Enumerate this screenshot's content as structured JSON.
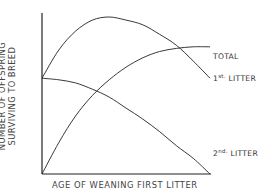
{
  "chart_data": {
    "type": "line",
    "title": "",
    "xlabel": "AGE OF WEANING FIRST LITTER",
    "ylabel_lines": [
      "NUMBER OF OFFSPRING",
      "SURVIVING TO BREED"
    ],
    "ylabel": "NUMBER OF OFFSPRING SURVIVING TO BREED",
    "x_ticks": [],
    "y_ticks": [],
    "grid": false,
    "legend": "inline labels at right end of each curve",
    "x": [
      0,
      0.1,
      0.2,
      0.3,
      0.4,
      0.5,
      0.6,
      0.7,
      0.8,
      0.9,
      1.0
    ],
    "xlim": [
      0,
      1
    ],
    "ylim": [
      0,
      1
    ],
    "series": [
      {
        "name": "TOTAL",
        "label_main": "TOTAL",
        "label_sup": "",
        "values": [
          0.61,
          0.79,
          0.91,
          0.98,
          1.0,
          0.98,
          0.95,
          0.89,
          0.82,
          0.72,
          0.61
        ]
      },
      {
        "name": "1st. LITTER",
        "label_main": " LITTER",
        "label_prefix": "1",
        "label_sup": "st.",
        "values": [
          0.0,
          0.2,
          0.37,
          0.5,
          0.6,
          0.68,
          0.74,
          0.78,
          0.8,
          0.81,
          0.81
        ]
      },
      {
        "name": "2nd. LITTER",
        "label_main": " LITTER",
        "label_prefix": "2",
        "label_sup": "nd.",
        "values": [
          0.61,
          0.6,
          0.58,
          0.54,
          0.49,
          0.42,
          0.35,
          0.27,
          0.18,
          0.1,
          0.0
        ]
      }
    ]
  }
}
